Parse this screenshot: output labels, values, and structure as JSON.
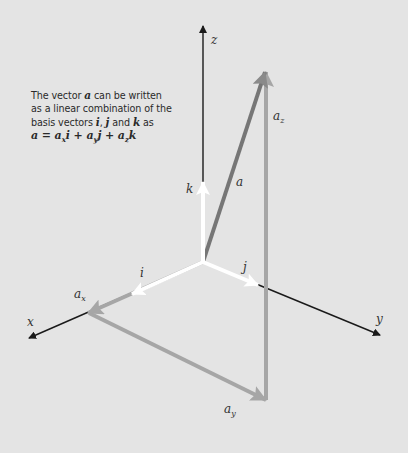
{
  "caption": {
    "line1_pre": "The vector ",
    "line1_var": "a",
    "line1_post": " can be written",
    "line2": "as a linear combination of the",
    "line3_pre": "basis vectors ",
    "line3_i": "i",
    "line3_comma": ", ",
    "line3_j": "j",
    "line3_and": " and ",
    "line3_k": "k",
    "line3_post": " as",
    "eq_a": "a",
    "eq_eq": " = ",
    "eq_ax": "a",
    "eq_ax_sub": "x",
    "eq_i": "i",
    "eq_plus1": " + ",
    "eq_ay": "a",
    "eq_ay_sub": "y",
    "eq_j": "j",
    "eq_plus2": " + ",
    "eq_az": "a",
    "eq_az_sub": "z",
    "eq_k": "k"
  },
  "labels": {
    "axis_x": "x",
    "axis_y": "y",
    "axis_z": "z",
    "basis_i": "i",
    "basis_j": "j",
    "basis_k": "k",
    "vector_a": "a",
    "comp_x": "a",
    "comp_x_sub": "x",
    "comp_y": "a",
    "comp_y_sub": "y",
    "comp_z": "a",
    "comp_z_sub": "z"
  },
  "colors": {
    "background": "#e4e4e4",
    "axis": "#1a1a1a",
    "basis": "#ffffff",
    "vector_a": "#707070",
    "components": "#a6a6a6"
  }
}
